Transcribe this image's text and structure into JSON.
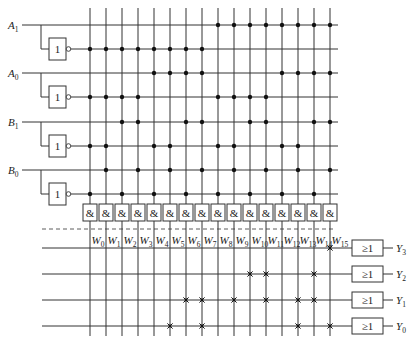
{
  "diagram": {
    "colors": {
      "line": "#333333",
      "background": "#ffffff",
      "dot": "#111111"
    },
    "inputs": [
      {
        "name": "A",
        "sub": "1",
        "label": "A1",
        "y": 25,
        "inv_y": 49
      },
      {
        "name": "A",
        "sub": "0",
        "label": "A0",
        "y": 73,
        "inv_y": 97
      },
      {
        "name": "B",
        "sub": "1",
        "label": "B1",
        "y": 122,
        "inv_y": 146
      },
      {
        "name": "B",
        "sub": "0",
        "label": "B0",
        "y": 170,
        "inv_y": 194
      }
    ],
    "inverter_label": "1",
    "and_gate_label": "&",
    "or_gate_label": "≥1",
    "minterms": [
      {
        "name": "W",
        "sub": "0"
      },
      {
        "name": "W",
        "sub": "1"
      },
      {
        "name": "W",
        "sub": "2"
      },
      {
        "name": "W",
        "sub": "3"
      },
      {
        "name": "W",
        "sub": "4"
      },
      {
        "name": "W",
        "sub": "5"
      },
      {
        "name": "W",
        "sub": "6"
      },
      {
        "name": "W",
        "sub": "7"
      },
      {
        "name": "W",
        "sub": "8"
      },
      {
        "name": "W",
        "sub": "9"
      },
      {
        "name": "W",
        "sub": "10"
      },
      {
        "name": "W",
        "sub": "11"
      },
      {
        "name": "W",
        "sub": "12"
      },
      {
        "name": "W",
        "sub": "13"
      },
      {
        "name": "W",
        "sub": "14"
      },
      {
        "name": "W",
        "sub": "15"
      }
    ],
    "outputs": [
      {
        "name": "Y",
        "sub": "3",
        "y": 248,
        "connections": [
          15
        ]
      },
      {
        "name": "Y",
        "sub": "2",
        "y": 274,
        "connections": [
          10,
          11,
          14
        ]
      },
      {
        "name": "Y",
        "sub": "1",
        "y": 300,
        "connections": [
          6,
          7,
          9,
          11,
          13,
          14
        ]
      },
      {
        "name": "Y",
        "sub": "0",
        "y": 326,
        "connections": [
          5,
          7,
          13,
          15
        ]
      }
    ]
  }
}
